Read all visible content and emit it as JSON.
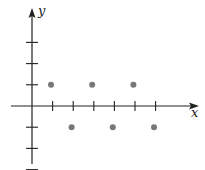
{
  "chart_data": {
    "type": "scatter",
    "title": "",
    "xlabel": "x",
    "ylabel": "y",
    "grid": false,
    "legend": null,
    "x_ticks": [
      1,
      2,
      3,
      4,
      5,
      6
    ],
    "y_ticks": [
      -3,
      -2,
      -1,
      1,
      2,
      3
    ],
    "tick_labels_shown": false,
    "xlim": [
      -1,
      8
    ],
    "ylim": [
      -4,
      5
    ],
    "series": [
      {
        "name": "points",
        "color": "#777777",
        "x": [
          1,
          2,
          3,
          4,
          5,
          6
        ],
        "y": [
          1,
          -1,
          1,
          -1,
          1,
          -1
        ]
      }
    ]
  },
  "colors": {
    "axis": "#222222",
    "point": "#777777",
    "background": "#ffffff"
  }
}
